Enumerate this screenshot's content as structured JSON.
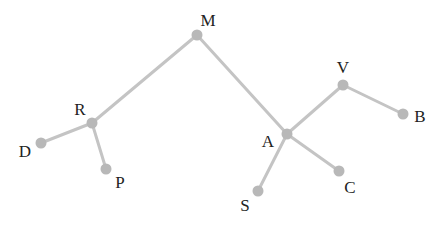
{
  "diagram": {
    "type": "tree",
    "colors": {
      "edge": "#c4c4c4",
      "node": "#b8b8b8",
      "label": "#222222",
      "background": "#ffffff"
    },
    "nodes": [
      {
        "id": "M",
        "label": "M",
        "x": 197,
        "y": 35,
        "lx": 208,
        "ly": 20
      },
      {
        "id": "R",
        "label": "R",
        "x": 92,
        "y": 123,
        "lx": 80,
        "ly": 109
      },
      {
        "id": "D",
        "label": "D",
        "x": 41,
        "y": 143,
        "lx": 25,
        "ly": 151
      },
      {
        "id": "P",
        "label": "P",
        "x": 106,
        "y": 169,
        "lx": 120,
        "ly": 182
      },
      {
        "id": "A",
        "label": "A",
        "x": 287,
        "y": 134,
        "lx": 268,
        "ly": 141
      },
      {
        "id": "V",
        "label": "V",
        "x": 343,
        "y": 85,
        "lx": 343,
        "ly": 67
      },
      {
        "id": "B",
        "label": "B",
        "x": 403,
        "y": 114,
        "lx": 420,
        "ly": 116
      },
      {
        "id": "S",
        "label": "S",
        "x": 258,
        "y": 191,
        "lx": 245,
        "ly": 205
      },
      {
        "id": "C",
        "label": "C",
        "x": 339,
        "y": 171,
        "lx": 350,
        "ly": 187
      }
    ],
    "edges": [
      {
        "from": "M",
        "to": "R"
      },
      {
        "from": "M",
        "to": "A"
      },
      {
        "from": "R",
        "to": "D"
      },
      {
        "from": "R",
        "to": "P"
      },
      {
        "from": "A",
        "to": "V"
      },
      {
        "from": "V",
        "to": "B"
      },
      {
        "from": "A",
        "to": "S"
      },
      {
        "from": "A",
        "to": "C"
      }
    ]
  }
}
